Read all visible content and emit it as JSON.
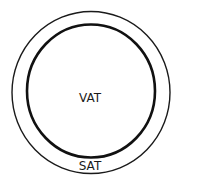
{
  "diagram": {
    "inner_label": "VAT",
    "outer_label": "SAT",
    "colors": {
      "background": "#ffffff",
      "stroke": "#1a1a1a"
    }
  }
}
